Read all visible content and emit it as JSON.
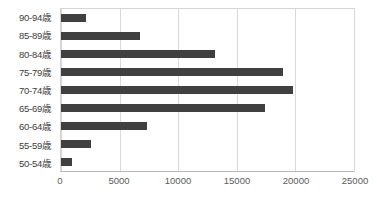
{
  "chart_data": {
    "type": "bar",
    "orientation": "horizontal",
    "title": "",
    "xlabel": "",
    "ylabel": "",
    "categories": [
      "90-94歳",
      "85-89歳",
      "80-84歳",
      "75-79歳",
      "70-74歳",
      "65-69歳",
      "60-64歳",
      "55-59歳",
      "50-54歳"
    ],
    "values": [
      2100,
      6700,
      13100,
      18900,
      19800,
      17400,
      7300,
      2600,
      900
    ],
    "xlim": [
      0,
      25000
    ],
    "xticks": [
      0,
      5000,
      10000,
      15000,
      20000,
      25000
    ],
    "xtick_labels": [
      "0",
      "5000",
      "10000",
      "15000",
      "20000",
      "25000"
    ],
    "grid": "vertical",
    "legend": "none",
    "series": [
      {
        "name": "",
        "color": "#404040",
        "values": [
          2100,
          6700,
          13100,
          18900,
          19800,
          17400,
          7300,
          2600,
          900
        ]
      }
    ]
  },
  "style": {
    "bar_color": "#404040",
    "gridline_color": "#d9d9d9",
    "axis_line_color": "#b8b8b8",
    "plot_border_color": "#d5d5d5",
    "label_color": "#3c3c3c",
    "tick_label_color": "#5a5a5a",
    "background": "#ffffff"
  }
}
